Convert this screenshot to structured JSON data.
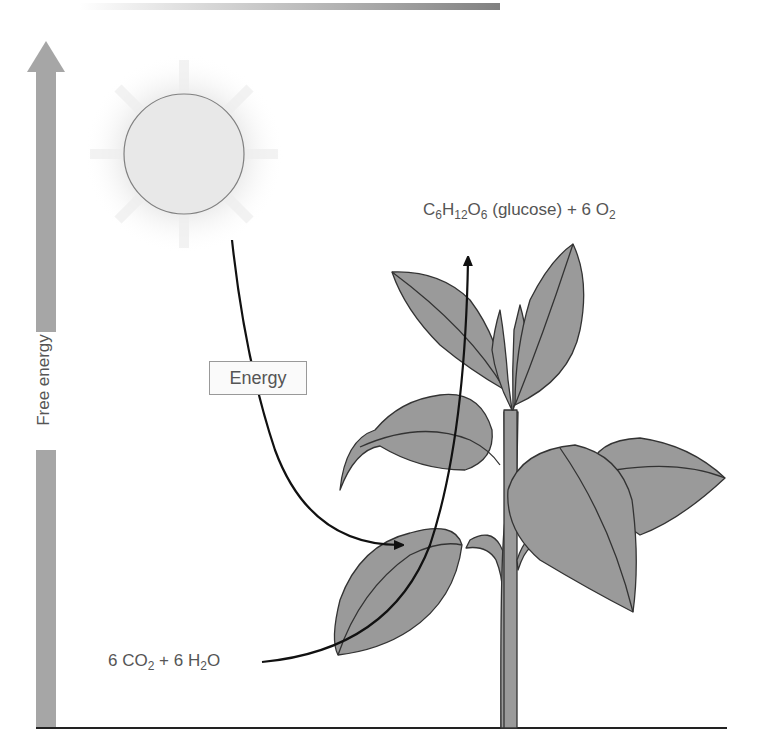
{
  "figure": {
    "axis": {
      "label": "Free energy",
      "direction": "up",
      "color": "#a6a6a6"
    },
    "sun": {
      "fill": "#e8e8e8",
      "stroke": "#808080"
    },
    "labels": {
      "energy": "Energy",
      "reactants": {
        "co2_coef": "6 CO",
        "co2_sub": "2",
        "plus": " + 6 H",
        "h2o_sub": "2",
        "h2o_end": "O"
      },
      "products": {
        "c": "C",
        "c_sub": "6",
        "h": "H",
        "h_sub": "12",
        "o": "O",
        "o_sub": "6",
        "glucose": " (glucose) + 6 O",
        "o2_sub": "2"
      }
    },
    "plant": {
      "leaf_fill": "#9a9a9a",
      "stroke": "#333333"
    },
    "ground_line_color": "#222222"
  }
}
